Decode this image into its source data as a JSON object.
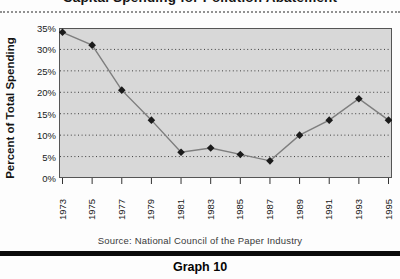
{
  "header": {
    "title": "Capital Spending for Pollution Abatement"
  },
  "chart_data": {
    "type": "line",
    "title": "Capital Spending for Pollution Abatement",
    "categories": [
      "1973",
      "1975",
      "1977",
      "1979",
      "1981",
      "1983",
      "1985",
      "1987",
      "1989",
      "1991",
      "1993",
      "1995"
    ],
    "values": [
      34,
      31,
      20.5,
      13.5,
      6,
      7,
      5.5,
      4,
      10,
      13.5,
      18.5,
      13.5
    ],
    "xlabel": "",
    "ylabel": "Percent of Total Spending",
    "ylim": [
      0,
      35
    ],
    "ytick_step": 5,
    "ytick_labels": [
      "0%",
      "5%",
      "10%",
      "15%",
      "20%",
      "25%",
      "30%",
      "35%"
    ],
    "grid": "horizontal-dotted",
    "legend": "none",
    "colors": {
      "plot_bg": "#d8d8d8",
      "plot_border": "#555555",
      "gridline": "#3f3f3f",
      "line": "#7e7e7e",
      "marker": "#1b1b1b",
      "tick": "#333333"
    },
    "marker": "diamond"
  },
  "footer": {
    "source": "Source: National Council of the Paper Industry",
    "caption": "Graph 10"
  }
}
